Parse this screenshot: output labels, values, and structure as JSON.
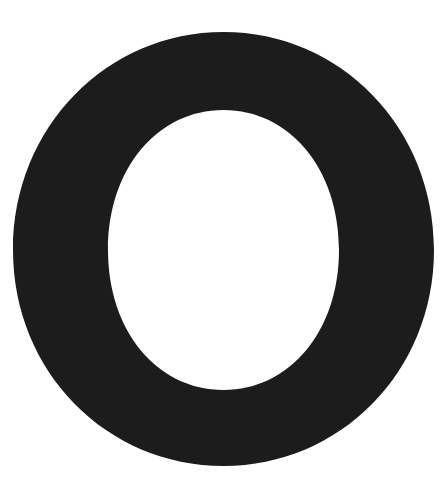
{
  "image": {
    "background": "#ffffff",
    "glyph": {
      "character": "O",
      "fill": "#1c1c1c",
      "outer": {
        "cx": 223.5,
        "cy": 249,
        "rx": 210,
        "ry": 217
      },
      "inner": {
        "cx": 223.5,
        "cy": 250,
        "rx": 116,
        "ry": 140
      }
    }
  }
}
